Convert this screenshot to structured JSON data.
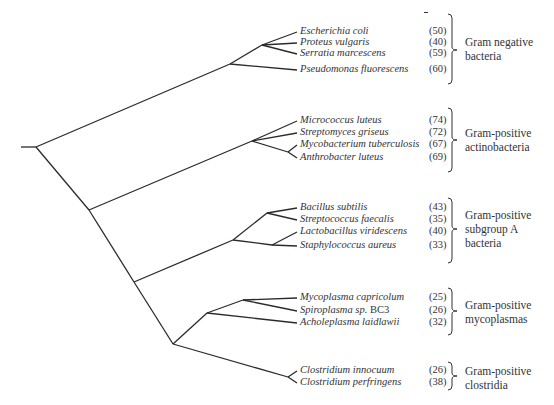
{
  "chart_data": {
    "type": "dendrogram",
    "title": "",
    "root_stub": {
      "x1": 21,
      "y": 147,
      "x2": 36
    },
    "groups": [
      {
        "name": "Gram negative bacteria",
        "label_lines": [
          "Gram negative",
          "bacteria"
        ],
        "bracket": {
          "top": 14,
          "bottom": 84,
          "mid": 50
        },
        "label_top": 35,
        "taxa": [
          {
            "name": "Escherichia coli",
            "count": "(50)",
            "y": 32
          },
          {
            "name": "Proteus vulgaris",
            "count": "(40)",
            "y": 43
          },
          {
            "name": "Serratia marcescens",
            "count": "(59)",
            "y": 54
          },
          {
            "name": "Pseudomonas fluorescens",
            "count": "(60)",
            "y": 70
          }
        ]
      },
      {
        "name": "Gram-positive actinobacteria",
        "label_lines": [
          "Gram-positive",
          "actinobacteria"
        ],
        "bracket": {
          "top": 108,
          "bottom": 172,
          "mid": 140
        },
        "label_top": 126,
        "taxa": [
          {
            "name": "Micrococcus luteus",
            "count": "(74)",
            "y": 121
          },
          {
            "name": "Streptomyces griseus",
            "count": "(72)",
            "y": 133
          },
          {
            "name": "Mycobacterium tuberculosis",
            "count": "(67)",
            "y": 145
          },
          {
            "name": "Anthrobacter luteus",
            "count": "(69)",
            "y": 158
          }
        ]
      },
      {
        "name": "Gram-positive subgroup A bacteria",
        "label_lines": [
          "Gram-positive",
          "subgroup A",
          "bacteria"
        ],
        "bracket": {
          "top": 198,
          "bottom": 263,
          "mid": 229
        },
        "label_top": 208,
        "taxa": [
          {
            "name": "Bacillus subtilis",
            "count": "(43)",
            "y": 208
          },
          {
            "name": "Streptococcus faecalis",
            "count": "(35)",
            "y": 220
          },
          {
            "name": "Lactobacillus viridescens",
            "count": "(40)",
            "y": 232
          },
          {
            "name": "Staphylococcus aureus",
            "count": "(33)",
            "y": 246
          }
        ]
      },
      {
        "name": "Gram-positive mycoplasmas",
        "label_lines": [
          "Gram-positive",
          "mycoplasmas"
        ],
        "bracket": {
          "top": 288,
          "bottom": 335,
          "mid": 311
        },
        "label_top": 298,
        "taxa": [
          {
            "name": "Mycoplasma capricolum",
            "count": "(25)",
            "y": 298
          },
          {
            "name": "Spiroplasma sp.",
            "suffix": "BC3",
            "count": "(26)",
            "y": 311
          },
          {
            "name": "Acholeplasma laidlawii",
            "count": "(32)",
            "y": 323
          }
        ]
      },
      {
        "name": "Gram-positive clostridia",
        "label_lines": [
          "Gram-positive",
          "clostridia"
        ],
        "bracket": {
          "top": 362,
          "bottom": 390,
          "mid": 376
        },
        "label_top": 364,
        "taxa": [
          {
            "name": "Clostridium innocuum",
            "count": "(26)",
            "y": 371
          },
          {
            "name": "Clostridium perfringens",
            "count": "(38)",
            "y": 383
          }
        ]
      }
    ],
    "edges": [
      [
        21,
        147,
        36,
        147
      ],
      [
        36,
        147,
        230,
        64
      ],
      [
        36,
        147,
        89,
        210
      ],
      [
        230,
        64,
        262,
        45
      ],
      [
        230,
        64,
        297,
        70
      ],
      [
        262,
        45,
        297,
        32
      ],
      [
        262,
        45,
        297,
        43
      ],
      [
        262,
        45,
        297,
        54
      ],
      [
        89,
        210,
        252,
        141
      ],
      [
        89,
        210,
        134,
        282
      ],
      [
        252,
        141,
        297,
        121
      ],
      [
        252,
        141,
        297,
        133
      ],
      [
        252,
        141,
        288,
        152
      ],
      [
        288,
        152,
        297,
        145
      ],
      [
        288,
        152,
        297,
        158
      ],
      [
        134,
        282,
        233,
        240
      ],
      [
        134,
        282,
        173,
        344
      ],
      [
        233,
        240,
        267,
        213
      ],
      [
        233,
        240,
        272,
        245
      ],
      [
        267,
        213,
        297,
        208
      ],
      [
        267,
        213,
        297,
        220
      ],
      [
        272,
        245,
        297,
        232
      ],
      [
        272,
        245,
        297,
        246
      ],
      [
        173,
        344,
        207,
        313
      ],
      [
        173,
        344,
        288,
        377
      ],
      [
        207,
        313,
        243,
        300
      ],
      [
        207,
        313,
        297,
        323
      ],
      [
        243,
        300,
        297,
        298
      ],
      [
        243,
        300,
        297,
        311
      ],
      [
        288,
        377,
        297,
        371
      ],
      [
        288,
        377,
        297,
        383
      ]
    ]
  }
}
